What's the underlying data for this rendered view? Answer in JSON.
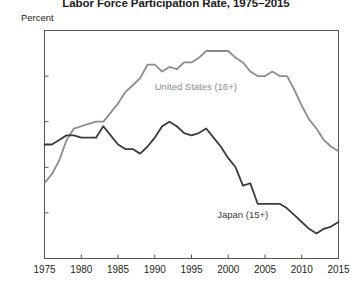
{
  "chart_data": {
    "type": "line",
    "title": "Labor Force Participation Rate, 1975–2015",
    "xlabel": "",
    "ylabel": "Percent",
    "ylim": [
      58,
      68
    ],
    "xlim": [
      1975,
      2015
    ],
    "yticks": [
      58,
      60,
      62,
      64,
      66,
      68
    ],
    "xticks": [
      1975,
      1980,
      1985,
      1990,
      1995,
      2000,
      2005,
      2010,
      2015
    ],
    "grid": false,
    "legend_position": "inline-annotation",
    "x": [
      1975,
      1976,
      1977,
      1978,
      1979,
      1980,
      1981,
      1982,
      1983,
      1984,
      1985,
      1986,
      1987,
      1988,
      1989,
      1990,
      1991,
      1992,
      1993,
      1994,
      1995,
      1996,
      1997,
      1998,
      1999,
      2000,
      2001,
      2002,
      2003,
      2004,
      2005,
      2006,
      2007,
      2008,
      2009,
      2010,
      2011,
      2012,
      2013,
      2014,
      2015
    ],
    "series": [
      {
        "name": "United States (16+)",
        "color": "#8c8c8c",
        "label_text": "United States (16+)",
        "values": [
          61.3,
          61.7,
          62.3,
          63.2,
          63.7,
          63.8,
          63.9,
          64.0,
          64.0,
          64.4,
          64.8,
          65.3,
          65.6,
          65.9,
          66.5,
          66.5,
          66.2,
          66.4,
          66.3,
          66.6,
          66.6,
          66.8,
          67.1,
          67.1,
          67.1,
          67.1,
          66.8,
          66.6,
          66.2,
          66.0,
          66.0,
          66.2,
          66.0,
          66.0,
          65.4,
          64.7,
          64.1,
          63.7,
          63.2,
          62.9,
          62.7
        ]
      },
      {
        "name": "Japan (15+)",
        "color": "#3b3b3b",
        "label_text": "Japan (15+)",
        "values": [
          63.0,
          63.0,
          63.2,
          63.4,
          63.4,
          63.3,
          63.3,
          63.3,
          63.8,
          63.4,
          63.0,
          62.8,
          62.8,
          62.6,
          62.9,
          63.3,
          63.8,
          64.0,
          63.8,
          63.5,
          63.4,
          63.5,
          63.7,
          63.3,
          62.9,
          62.4,
          62.0,
          61.2,
          61.3,
          60.4,
          60.4,
          60.4,
          60.4,
          60.2,
          59.9,
          59.6,
          59.3,
          59.1,
          59.3,
          59.4,
          59.6
        ]
      }
    ]
  },
  "annotations": {
    "us_label": "United States (16+)",
    "japan_label": "Japan (15+)"
  },
  "colors": {
    "us_line": "#8c8c8c",
    "japan_line": "#3b3b3b",
    "axis": "#555555",
    "text": "#231f20"
  }
}
